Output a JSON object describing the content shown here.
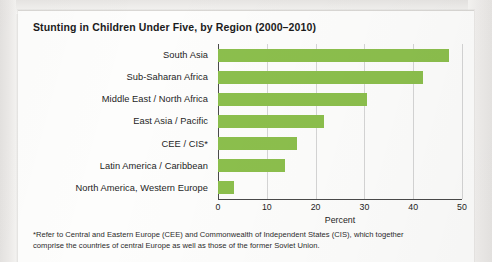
{
  "chart_data": {
    "type": "bar",
    "orientation": "horizontal",
    "title": "Stunting in Children Under Five, by Region (2000–2010)",
    "xlabel": "Percent",
    "ylabel": "",
    "xlim": [
      0,
      50
    ],
    "xticks": [
      0,
      10,
      20,
      30,
      40,
      50
    ],
    "xtick_labels": [
      "0",
      "10",
      "20",
      "30",
      "40",
      "50"
    ],
    "grid": true,
    "legend": null,
    "bar_color": "#8cbf4d",
    "categories": [
      "South Asia",
      "Sub-Saharan Africa",
      "Middle East / North Africa",
      "East Asia / Pacific",
      "CEE / CIS*",
      "Latin America / Caribbean",
      "North America, Western Europe"
    ],
    "values": [
      47.3,
      42.0,
      30.5,
      21.8,
      16.2,
      13.7,
      3.3
    ]
  },
  "footnote": {
    "line1": "*Refer to Central and Eastern Europe (CEE) and Commonwealth of Independent States (CIS), which together",
    "line2": "comprise the countries of central Europe as well as those of the former Soviet Union."
  }
}
